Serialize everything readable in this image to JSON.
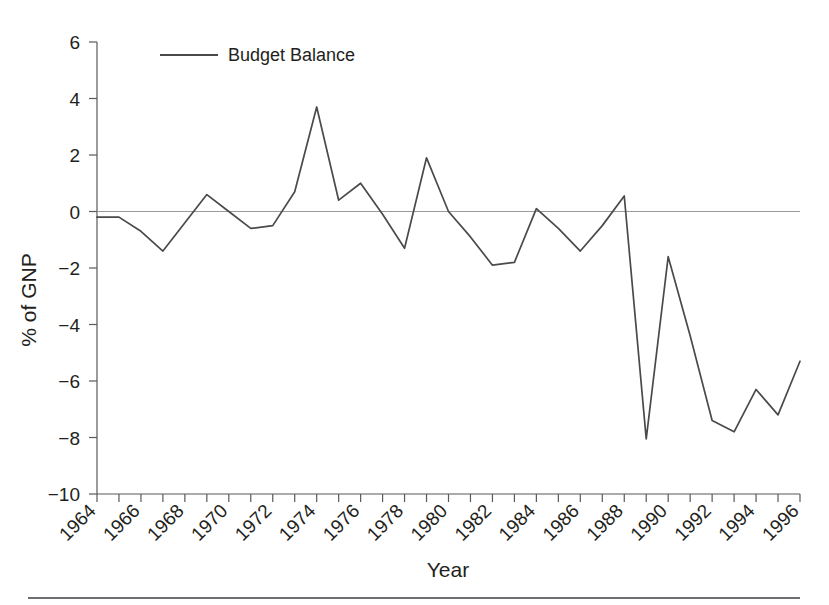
{
  "chart_data": {
    "type": "line",
    "title": "",
    "xlabel": "Year",
    "ylabel": "% of GNP",
    "xlim": [
      1964,
      1996
    ],
    "ylim": [
      -10,
      6
    ],
    "grid": false,
    "legend_position": "top-left-inside",
    "y_ticks": [
      6,
      4,
      2,
      0,
      -2,
      -4,
      -6,
      -8,
      -10
    ],
    "y_tick_labels": [
      "6",
      "4",
      "2",
      "0",
      "−2",
      "−4",
      "−6",
      "−8",
      "−10"
    ],
    "x_ticks": [
      1964,
      1966,
      1968,
      1970,
      1972,
      1974,
      1976,
      1978,
      1980,
      1982,
      1984,
      1986,
      1988,
      1990,
      1992,
      1994,
      1996
    ],
    "x_tick_labels": [
      "1964",
      "1966",
      "1968",
      "1970",
      "1972",
      "1974",
      "1976",
      "1978",
      "1980",
      "1982",
      "1984",
      "1986",
      "1988",
      "1990",
      "1992",
      "1994",
      "1996"
    ],
    "x_minor_tick_interval": 1,
    "zero_reference_line": 0,
    "series": [
      {
        "name": "Budget Balance",
        "color": "#4a4a4a",
        "x": [
          1964,
          1965,
          1966,
          1967,
          1968,
          1969,
          1970,
          1971,
          1972,
          1973,
          1974,
          1975,
          1976,
          1977,
          1978,
          1979,
          1980,
          1981,
          1982,
          1983,
          1984,
          1985,
          1986,
          1987,
          1988,
          1989,
          1990,
          1991,
          1992,
          1993,
          1994,
          1995,
          1996
        ],
        "values": [
          -0.2,
          -0.2,
          -0.7,
          -1.4,
          -0.4,
          0.6,
          0.0,
          -0.6,
          -0.5,
          0.7,
          3.7,
          0.4,
          1.0,
          -0.1,
          -1.3,
          1.9,
          0.0,
          -0.9,
          -1.9,
          -1.8,
          0.1,
          -0.6,
          -1.4,
          -0.5,
          0.55,
          -8.05,
          -1.6,
          -4.4,
          -7.4,
          -7.8,
          -6.3,
          -7.2,
          -5.3
        ]
      }
    ]
  },
  "legend": {
    "entries": [
      {
        "label": "Budget Balance"
      }
    ]
  },
  "axes": {
    "y_axis_title": "% of GNP",
    "x_axis_title": "Year"
  }
}
